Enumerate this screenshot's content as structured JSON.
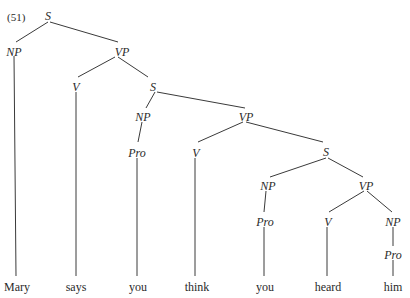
{
  "example_number": "(51)",
  "nodes": {
    "s0": "S",
    "np0": "NP",
    "vp0": "VP",
    "v0": "V",
    "s1": "S",
    "np1": "NP",
    "vp1": "VP",
    "pro1": "Pro",
    "v1": "V",
    "s2": "S",
    "np2": "NP",
    "vp2": "VP",
    "pro2": "Pro",
    "v2": "V",
    "np3": "NP",
    "pro3": "Pro"
  },
  "leaves": [
    "Mary",
    "says",
    "you",
    "think",
    "you",
    "heard",
    "him"
  ]
}
